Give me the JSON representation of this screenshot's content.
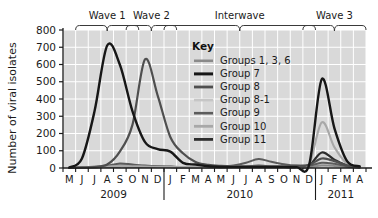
{
  "chart_data": {
    "type": "line",
    "title": "",
    "xlabel": "",
    "ylabel": "Number of viral isolates",
    "ylim": [
      0,
      800
    ],
    "ytick_values": [
      0,
      100,
      200,
      300,
      400,
      500,
      600,
      700,
      800
    ],
    "ytick_labels": [
      "0",
      "100",
      "200",
      "300",
      "400",
      "500",
      "600",
      "700",
      "800"
    ],
    "grid": true,
    "legend_position": "inside-top-center",
    "legend_title": "Key",
    "x": [
      "M",
      "J",
      "J",
      "A",
      "S",
      "O",
      "N",
      "D",
      "J",
      "F",
      "M",
      "A",
      "M",
      "J",
      "J",
      "A",
      "S",
      "O",
      "N",
      "D",
      "J",
      "F",
      "M",
      "A"
    ],
    "x_full": [
      "May 2009",
      "Jun 2009",
      "Jul 2009",
      "Aug 2009",
      "Sep 2009",
      "Oct 2009",
      "Nov 2009",
      "Dec 2009",
      "Jan 2010",
      "Feb 2010",
      "Mar 2010",
      "Apr 2010",
      "May 2010",
      "Jun 2010",
      "Jul 2010",
      "Aug 2010",
      "Sep 2010",
      "Oct 2010",
      "Nov 2010",
      "Dec 2010",
      "Jan 2011",
      "Feb 2011",
      "Mar 2011",
      "Apr 2011"
    ],
    "year_groups": [
      {
        "label": "2009",
        "start_index": 0,
        "end_index": 7
      },
      {
        "label": "2010",
        "start_index": 8,
        "end_index": 19
      },
      {
        "label": "2011",
        "start_index": 20,
        "end_index": 23
      }
    ],
    "annotations": [
      {
        "label": "Wave 1",
        "start_index": 1,
        "end_index": 5
      },
      {
        "label": "Wave 2",
        "start_index": 5,
        "end_index": 8
      },
      {
        "label": "Interwave",
        "start_index": 8,
        "end_index": 19
      },
      {
        "label": "Wave 3",
        "start_index": 19,
        "end_index": 23
      }
    ],
    "series": [
      {
        "name": "Groups 1, 3, 6",
        "color": "#8a8a8a",
        "width": 2.0,
        "values": [
          2,
          3,
          8,
          14,
          18,
          16,
          12,
          9,
          6,
          5,
          5,
          6,
          6,
          8,
          10,
          14,
          10,
          8,
          6,
          6,
          14,
          12,
          6,
          3
        ]
      },
      {
        "name": "Group 7",
        "color": "#171717",
        "width": 2.4,
        "values": [
          3,
          55,
          330,
          710,
          600,
          330,
          150,
          110,
          95,
          30,
          20,
          10,
          6,
          5,
          5,
          5,
          5,
          5,
          5,
          20,
          515,
          230,
          40,
          10
        ]
      },
      {
        "name": "Group 8",
        "color": "#4f4f4f",
        "width": 2.2,
        "values": [
          1,
          2,
          6,
          20,
          95,
          250,
          630,
          420,
          180,
          85,
          35,
          18,
          12,
          10,
          10,
          12,
          10,
          10,
          12,
          18,
          55,
          40,
          15,
          6
        ]
      },
      {
        "name": "Group 8-1",
        "color": "#c6c6c6",
        "width": 2.0,
        "values": [
          1,
          2,
          4,
          8,
          14,
          10,
          8,
          6,
          5,
          4,
          4,
          4,
          5,
          6,
          8,
          10,
          8,
          6,
          6,
          8,
          22,
          18,
          8,
          4
        ]
      },
      {
        "name": "Group 9",
        "color": "#5c5c5c",
        "width": 2.0,
        "values": [
          1,
          2,
          5,
          12,
          26,
          20,
          14,
          10,
          8,
          6,
          6,
          6,
          8,
          14,
          30,
          52,
          36,
          22,
          14,
          14,
          30,
          24,
          10,
          4
        ]
      },
      {
        "name": "Group 10",
        "color": "#a8a8a8",
        "width": 2.2,
        "values": [
          1,
          2,
          4,
          8,
          12,
          10,
          8,
          7,
          6,
          5,
          5,
          5,
          6,
          7,
          9,
          12,
          10,
          9,
          9,
          22,
          265,
          120,
          25,
          6
        ]
      },
      {
        "name": "Group 11",
        "color": "#2d2d2d",
        "width": 2.2,
        "values": [
          1,
          2,
          4,
          7,
          10,
          9,
          8,
          7,
          6,
          5,
          5,
          5,
          5,
          6,
          8,
          10,
          9,
          8,
          9,
          16,
          90,
          48,
          14,
          4
        ]
      }
    ]
  },
  "plot": {
    "background": "#d9d9d9",
    "gridline_color": "#ffffff",
    "axis_color": "#1b1b1b",
    "page_background": "#ffffff"
  }
}
